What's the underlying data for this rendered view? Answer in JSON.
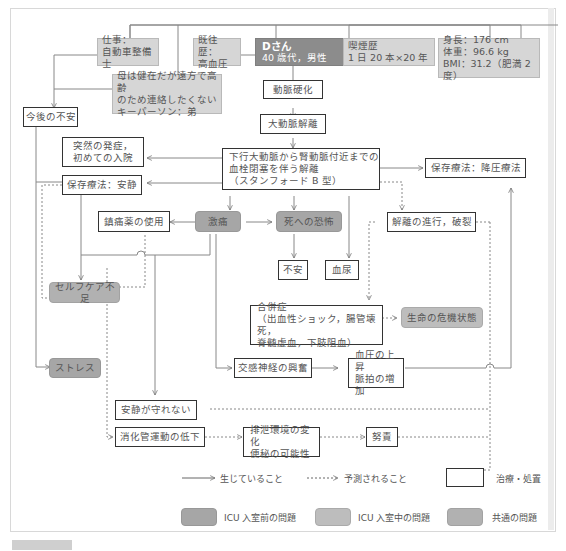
{
  "patient": {
    "name": "Dさん",
    "profile": "40 歳代，男性"
  },
  "background": {
    "occupation": "仕事：\n自動車整備士",
    "history": "既往歴：\n高血圧",
    "smoking": "喫煙歴\n1 日 20 本×20 年",
    "body": "身長：176 cm\n体重：96.6 kg\nBMI：31.2（肥満 2 度）",
    "family": "母は健在だが遠方で高齢\nのため連絡したくない\nキーパーソン：弟"
  },
  "nodes": {
    "future_anxiety": "今後の不安",
    "arteriosclerosis": "動脈硬化",
    "aortic_dissection": "大動脈解離",
    "dissection_detail": "下行大動脈から腎動脈付近までの\n血栓閉塞を伴う解離\n（スタンフォード B 型）",
    "sudden_onset": "突然の発症，\n初めての入院",
    "conservative_rest": "保存療法：安静",
    "conservative_bp": "保存療法：降圧療法",
    "analgesic": "鎮痛薬の使用",
    "severe_pain": "激痛",
    "fear_of_death": "死への恐怖",
    "anxiety": "不安",
    "hematuria": "血尿",
    "progression": "解離の進行，破裂",
    "self_care": "セルフケア不足",
    "complications": "合併症\n（出血性ショック，腸管壊死，\n脊髄虚血，下肢阻血）",
    "life_crisis": "生命の危機状態",
    "stress": "ストレス",
    "sympathetic": "交感神経の興奮",
    "bp_rise": "血圧の上昇\n脈拍の増加",
    "cannot_rest": "安静が守れない",
    "gi_decrease": "消化管運動の低下",
    "excretion_change": "排泄環境の変化\n便秘の可能性",
    "straining": "努責"
  },
  "legend": {
    "solid": "生じていること",
    "dashed": "予測されること",
    "treatment": "治療・処置",
    "pre_icu": "ICU 入室前の問題",
    "in_icu": "ICU 入室中の問題",
    "common": "共通の問題"
  },
  "colors": {
    "patient": "#8c8c8c",
    "info": "#d6d6d6",
    "pre_icu": "#a6a6a6",
    "in_icu": "#bdbdbd",
    "common": "#b1b1b1",
    "line": "#777777"
  }
}
